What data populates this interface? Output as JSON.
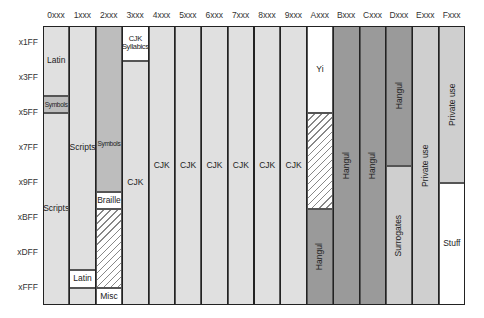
{
  "chart": {
    "title": "",
    "columns": [
      "0xxx",
      "1xxx",
      "2xxx",
      "3xxx",
      "4xxx",
      "5xxx",
      "6xxx",
      "7xxx",
      "8xxx",
      "9xxx",
      "Axxx",
      "Bxxx",
      "Cxxx",
      "Dxxx",
      "Exxx",
      "Fxxx"
    ],
    "rows": [
      "x1FF",
      "x3FF",
      "x5FF",
      "x7FF",
      "x9FF",
      "xBFF",
      "xDFF",
      "xFFF"
    ],
    "colors": {
      "light": "#e0e0e0",
      "medium": "#bdbdbd",
      "dark": "#9a9a9a",
      "private": "#cfcfcf",
      "white": "#ffffff",
      "line": "#222222"
    },
    "blocks": [
      {
        "id": "latin-0",
        "col": 0,
        "start": 0,
        "end": 8,
        "label": "Latin",
        "color": "light",
        "style": "normal"
      },
      {
        "id": "symbols-0",
        "col": 0,
        "start": 8,
        "end": 10,
        "label": "Symbols",
        "color": "medium",
        "style": "small"
      },
      {
        "id": "scripts-0",
        "col": 0,
        "start": 10,
        "end": 32,
        "label": "Scripts",
        "color": "light",
        "style": "normal"
      },
      {
        "id": "scripts-1",
        "col": 1,
        "start": 0,
        "end": 28,
        "label": "Scripts",
        "color": "light",
        "style": "normal"
      },
      {
        "id": "latin-1",
        "col": 1,
        "start": 28,
        "end": 30,
        "label": "Latin",
        "color": "white",
        "style": "normal"
      },
      {
        "id": "blank-1",
        "col": 1,
        "start": 30,
        "end": 32,
        "label": "",
        "color": "light",
        "style": "normal"
      },
      {
        "id": "symbols-2",
        "col": 2,
        "start": 0,
        "end": 19,
        "label": "Symbols",
        "color": "medium",
        "style": "small-bottom"
      },
      {
        "id": "braille-2",
        "col": 2,
        "start": 19,
        "end": 21,
        "label": "Braille",
        "color": "white",
        "style": "normal"
      },
      {
        "id": "unassigned-2",
        "col": 2,
        "start": 21,
        "end": 30,
        "label": "",
        "color": "white",
        "style": "hatch"
      },
      {
        "id": "misc-2",
        "col": 2,
        "start": 30,
        "end": 32,
        "label": "Misc",
        "color": "white",
        "style": "normal"
      },
      {
        "id": "cjk-syllabics-3",
        "col": 3,
        "start": 0,
        "end": 4,
        "label": "CJK Syllabics",
        "color": "white",
        "style": "small2"
      },
      {
        "id": "cjk-3",
        "col": 3,
        "start": 4,
        "end": 32,
        "label": "CJK",
        "color": "light",
        "style": "normal"
      },
      {
        "id": "cjk-4",
        "col": 4,
        "start": 0,
        "end": 32,
        "label": "CJK",
        "color": "light",
        "style": "normal"
      },
      {
        "id": "cjk-5",
        "col": 5,
        "start": 0,
        "end": 32,
        "label": "CJK",
        "color": "light",
        "style": "normal"
      },
      {
        "id": "cjk-6",
        "col": 6,
        "start": 0,
        "end": 32,
        "label": "CJK",
        "color": "light",
        "style": "normal"
      },
      {
        "id": "cjk-7",
        "col": 7,
        "start": 0,
        "end": 32,
        "label": "CJK",
        "color": "light",
        "style": "normal"
      },
      {
        "id": "cjk-8",
        "col": 8,
        "start": 0,
        "end": 32,
        "label": "CJK",
        "color": "light",
        "style": "normal"
      },
      {
        "id": "cjk-9",
        "col": 9,
        "start": 0,
        "end": 32,
        "label": "CJK",
        "color": "light",
        "style": "normal"
      },
      {
        "id": "yi-a",
        "col": 10,
        "start": 0,
        "end": 10,
        "label": "Yi",
        "color": "white",
        "style": "normal"
      },
      {
        "id": "unassigned-a",
        "col": 10,
        "start": 10,
        "end": 21,
        "label": "",
        "color": "white",
        "style": "hatch"
      },
      {
        "id": "hangul-a",
        "col": 10,
        "start": 21,
        "end": 32,
        "label": "Hangul",
        "color": "dark",
        "style": "vert"
      },
      {
        "id": "hangul-b",
        "col": 11,
        "start": 0,
        "end": 32,
        "label": "Hangul",
        "color": "dark",
        "style": "vert"
      },
      {
        "id": "hangul-c",
        "col": 12,
        "start": 0,
        "end": 32,
        "label": "Hangul",
        "color": "dark",
        "style": "vert"
      },
      {
        "id": "hangul-d",
        "col": 13,
        "start": 0,
        "end": 16,
        "label": "Hangul",
        "color": "dark",
        "style": "vert"
      },
      {
        "id": "surrogates-d",
        "col": 13,
        "start": 16,
        "end": 32,
        "label": "Surrogates",
        "color": "private",
        "style": "vert"
      },
      {
        "id": "private-e",
        "col": 14,
        "start": 0,
        "end": 32,
        "label": "Private use",
        "color": "private",
        "style": "vert"
      },
      {
        "id": "private-f",
        "col": 15,
        "start": 0,
        "end": 18,
        "label": "Private use",
        "color": "private",
        "style": "vert"
      },
      {
        "id": "stuff-f",
        "col": 15,
        "start": 18,
        "end": 32,
        "label": "Stuff",
        "color": "white",
        "style": "normal"
      }
    ]
  },
  "chart_data": {
    "type": "table",
    "xlabel": "High hex digit of code point",
    "ylabel": "Low 3 hex digits (end of 0x200 band)",
    "categories": [
      "0xxx",
      "1xxx",
      "2xxx",
      "3xxx",
      "4xxx",
      "5xxx",
      "6xxx",
      "7xxx",
      "8xxx",
      "9xxx",
      "Axxx",
      "Bxxx",
      "Cxxx",
      "Dxxx",
      "Exxx",
      "Fxxx"
    ],
    "row_ticks": [
      "x1FF",
      "x3FF",
      "x5FF",
      "x7FF",
      "x9FF",
      "xBFF",
      "xDFF",
      "xFFF"
    ],
    "ranges": [
      {
        "from": "0000",
        "to": "03FF",
        "label": "Latin"
      },
      {
        "from": "0400",
        "to": "04FF",
        "label": "Symbols"
      },
      {
        "from": "0500",
        "to": "1DFF",
        "label": "Scripts"
      },
      {
        "from": "1E00",
        "to": "1EFF",
        "label": "Latin"
      },
      {
        "from": "2000",
        "to": "27FF",
        "label": "Symbols"
      },
      {
        "from": "2800",
        "to": "28FF",
        "label": "Braille"
      },
      {
        "from": "2900",
        "to": "2DFF",
        "label": "(unassigned)"
      },
      {
        "from": "2E00",
        "to": "2FFF",
        "label": "Misc"
      },
      {
        "from": "3000",
        "to": "31FF",
        "label": "CJK Syllabics"
      },
      {
        "from": "3200",
        "to": "9FFF",
        "label": "CJK"
      },
      {
        "from": "A000",
        "to": "A4FF",
        "label": "Yi"
      },
      {
        "from": "A500",
        "to": "AA7F",
        "label": "(unassigned)"
      },
      {
        "from": "AA80",
        "to": "D7FF",
        "label": "Hangul"
      },
      {
        "from": "D800",
        "to": "DFFF",
        "label": "Surrogates"
      },
      {
        "from": "E000",
        "to": "F8FF",
        "label": "Private use"
      },
      {
        "from": "F900",
        "to": "FFFF",
        "label": "Stuff"
      }
    ]
  }
}
